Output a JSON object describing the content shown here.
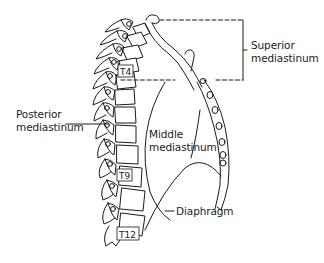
{
  "diagram": {
    "labels": {
      "superior": [
        "Superior",
        "mediastinum"
      ],
      "posterior": [
        "Posterior",
        "mediastinum"
      ],
      "middle": [
        "Middle",
        "mediastinum"
      ],
      "diaphragm": "Diaphragm"
    },
    "vertebra_labels": {
      "t4": "T4",
      "t9": "T9",
      "t12": "T12"
    },
    "colors": {
      "line": "#1a1a1a",
      "background": "#ffffff"
    }
  }
}
